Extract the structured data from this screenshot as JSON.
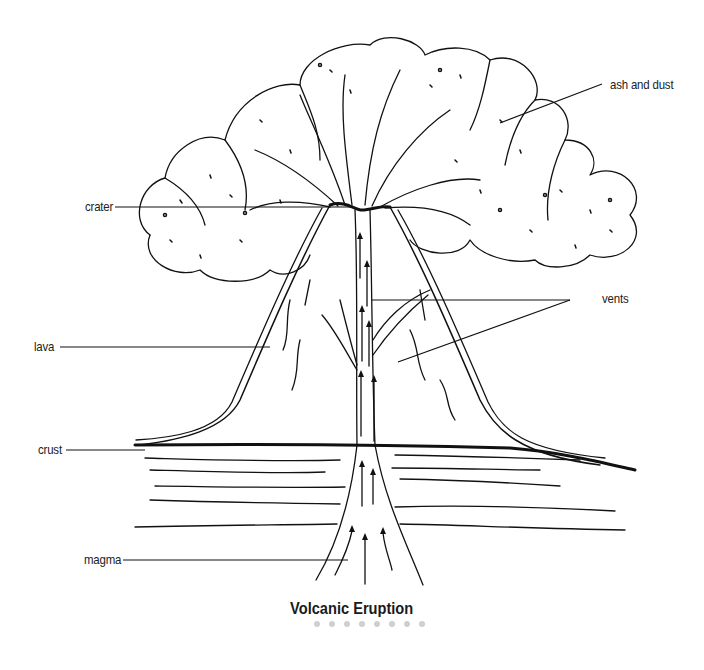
{
  "diagram": {
    "title": "Volcanic Eruption",
    "style": {
      "ink": "#111111",
      "background": "#ffffff",
      "dot_color": "#cfcfcf"
    },
    "labels": [
      {
        "id": "ash",
        "text": "ash and dust"
      },
      {
        "id": "crater",
        "text": "crater"
      },
      {
        "id": "vents",
        "text": "vents"
      },
      {
        "id": "lava",
        "text": "lava"
      },
      {
        "id": "crust",
        "text": "crust"
      },
      {
        "id": "magma",
        "text": "magma"
      }
    ],
    "pagination_dots": 8
  }
}
